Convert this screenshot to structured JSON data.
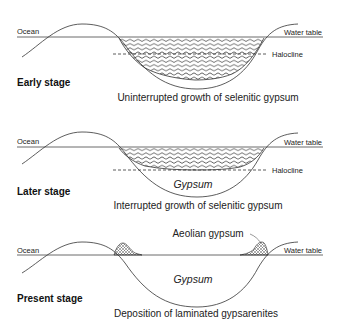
{
  "diagram": {
    "panels": [
      {
        "stage_label": "Early stage",
        "caption": "Uninterrupted growth of selenitic gypsum",
        "left_label": "Ocean",
        "right_label": "Water table",
        "halocline_label": "Halocline"
      },
      {
        "stage_label": "Later stage",
        "caption": "Interrupted growth of selenitic gypsum",
        "left_label": "Ocean",
        "right_label": "Water table",
        "halocline_label": "Halocline",
        "fill_label": "Gypsum"
      },
      {
        "stage_label": "Present stage",
        "caption": "Deposition of laminated gypsarenites",
        "left_label": "Ocean",
        "right_label": "Water table",
        "fill_label": "Gypsum",
        "aeolian_label": "Aeolian gypsum"
      }
    ]
  }
}
